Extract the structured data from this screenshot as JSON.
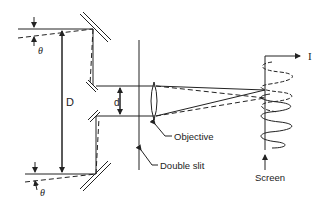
{
  "diagram": {
    "type": "stellar-interferometer",
    "labels": {
      "baseline": "D",
      "slit_separation": "d",
      "angle_top": "θ",
      "angle_bottom": "θ",
      "intensity_axis": "I",
      "objective": "Objective",
      "double_slit": "Double slit",
      "screen": "Screen"
    },
    "colors": {
      "ink": "#222222",
      "background": "#ffffff"
    }
  }
}
